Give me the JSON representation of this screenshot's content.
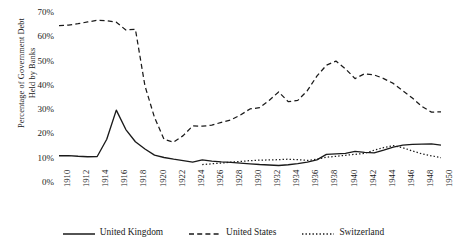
{
  "chart_data": {
    "type": "line",
    "title": "",
    "xlabel": "",
    "ylabel": "Percentage of Government Debt Held by Banks",
    "ylabel_line1": "Percentage of Government Debt",
    "ylabel_line2": "Held by Banks",
    "xlim": [
      1910,
      1950
    ],
    "ylim": [
      0,
      70
    ],
    "ytick_labels": [
      "70%",
      "60%",
      "50%",
      "40%",
      "30%",
      "20%",
      "10%",
      "0%"
    ],
    "ytick_values": [
      70,
      60,
      50,
      40,
      30,
      20,
      10,
      0
    ],
    "xtick_labels": [
      "1910",
      "1912",
      "1914",
      "1916",
      "1918",
      "1920",
      "1922",
      "1924",
      "1926",
      "1928",
      "1930",
      "1932",
      "1934",
      "1936",
      "1938",
      "1940",
      "1942",
      "1944",
      "1946",
      "1948",
      "1950"
    ],
    "xtick_values": [
      1910,
      1912,
      1914,
      1916,
      1918,
      1920,
      1922,
      1924,
      1926,
      1928,
      1930,
      1932,
      1934,
      1936,
      1938,
      1940,
      1942,
      1944,
      1946,
      1948,
      1950
    ],
    "grid": false,
    "legend_position": "bottom",
    "series": [
      {
        "name": "United Kingdom",
        "style": "solid",
        "color": "#1a1a1a",
        "x": [
          1910,
          1911,
          1912,
          1913,
          1914,
          1915,
          1916,
          1917,
          1918,
          1919,
          1920,
          1921,
          1922,
          1923,
          1924,
          1925,
          1926,
          1927,
          1928,
          1929,
          1930,
          1931,
          1932,
          1933,
          1934,
          1935,
          1936,
          1937,
          1938,
          1939,
          1940,
          1941,
          1942,
          1943,
          1944,
          1945,
          1946,
          1947,
          1948,
          1949,
          1950
        ],
        "values": [
          11.2,
          11.3,
          11.0,
          10.8,
          10.9,
          18.0,
          30.0,
          22.0,
          17.0,
          14.0,
          11.5,
          10.5,
          9.8,
          9.2,
          8.6,
          9.5,
          9.0,
          8.7,
          8.5,
          8.2,
          7.9,
          7.6,
          7.4,
          7.2,
          7.5,
          8.0,
          8.6,
          9.5,
          11.8,
          12.0,
          12.2,
          13.0,
          12.6,
          12.4,
          13.5,
          14.8,
          15.6,
          15.9,
          16.0,
          16.1,
          15.6
        ]
      },
      {
        "name": "United States",
        "style": "dashed",
        "color": "#1a1a1a",
        "x": [
          1910,
          1911,
          1912,
          1913,
          1914,
          1915,
          1916,
          1917,
          1918,
          1919,
          1920,
          1921,
          1922,
          1923,
          1924,
          1925,
          1926,
          1927,
          1928,
          1929,
          1930,
          1931,
          1932,
          1933,
          1934,
          1935,
          1936,
          1937,
          1938,
          1939,
          1940,
          1941,
          1942,
          1943,
          1944,
          1945,
          1946,
          1947,
          1948,
          1949,
          1950
        ],
        "values": [
          64.8,
          65.0,
          65.6,
          66.3,
          67.0,
          66.8,
          66.2,
          63.0,
          63.3,
          40.0,
          27.0,
          18.0,
          16.8,
          19.5,
          23.5,
          23.4,
          23.8,
          25.0,
          26.0,
          28.0,
          30.5,
          31.0,
          34.0,
          37.5,
          33.5,
          34.0,
          38.0,
          44.0,
          48.5,
          50.2,
          47.0,
          43.0,
          45.0,
          44.5,
          43.0,
          41.0,
          38.0,
          35.0,
          31.5,
          29.2,
          29.3
        ]
      },
      {
        "name": "Switzerland",
        "style": "dotted",
        "color": "#1a1a1a",
        "x": [
          1925,
          1926,
          1927,
          1928,
          1929,
          1930,
          1931,
          1932,
          1933,
          1934,
          1935,
          1936,
          1937,
          1938,
          1939,
          1940,
          1941,
          1942,
          1943,
          1944,
          1945,
          1946,
          1947,
          1948,
          1949,
          1950
        ],
        "values": [
          7.6,
          7.9,
          8.2,
          8.6,
          8.9,
          9.2,
          9.4,
          9.5,
          9.6,
          9.8,
          9.6,
          9.3,
          9.8,
          10.6,
          11.0,
          11.4,
          11.8,
          12.2,
          13.5,
          14.6,
          15.4,
          14.5,
          13.2,
          12.0,
          11.2,
          10.4
        ]
      }
    ]
  },
  "legend": {
    "items": [
      {
        "label": "United Kingdom",
        "style": "solid"
      },
      {
        "label": "United States",
        "style": "dashed"
      },
      {
        "label": "Switzerland",
        "style": "dotted"
      }
    ]
  }
}
